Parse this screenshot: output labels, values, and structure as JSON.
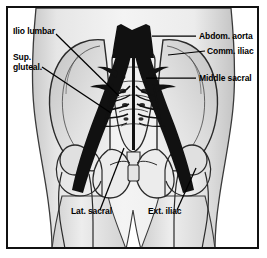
{
  "figure": {
    "border_color": "#111111",
    "background_color": "#ffffff",
    "vessel_color": "#111111",
    "bone_outline_color": "#2a2a2a",
    "body_fill_light": "#f2f2f2",
    "body_fill_mid": "#d9d9d9",
    "body_fill_dark": "#b8b8b8"
  },
  "labels": {
    "ilio_lumbar": "Ilio lumbar",
    "sup_gluteal_line1": "Sup.",
    "sup_gluteal_line2": "gluteal.",
    "abdom_aorta": "Abdom. aorta",
    "comm_iliac": "Comm. iliac",
    "middle_sacral": "Middle sacral",
    "lat_sacral": "Lat. sacral",
    "ext_iliac": "Ext. iliac"
  },
  "leader_lines": [
    {
      "name": "ilio-lumbar-leader",
      "x1": 56,
      "y1": 34,
      "x2": 119,
      "y2": 96
    },
    {
      "name": "sup-gluteal-leader",
      "x1": 42,
      "y1": 67,
      "x2": 111,
      "y2": 113
    },
    {
      "name": "abdom-aorta-leader",
      "x1": 196,
      "y1": 36,
      "x2": 152,
      "y2": 36
    },
    {
      "name": "comm-iliac-leader",
      "x1": 205,
      "y1": 51,
      "x2": 168,
      "y2": 55
    },
    {
      "name": "middle-sacral-leader",
      "x1": 196,
      "y1": 78,
      "x2": 146,
      "y2": 78
    },
    {
      "name": "lat-sacral-leader",
      "x1": 100,
      "y1": 210,
      "x2": 124,
      "y2": 148
    },
    {
      "name": "ext-iliac-leader",
      "x1": 177,
      "y1": 210,
      "x2": 196,
      "y2": 168
    }
  ]
}
